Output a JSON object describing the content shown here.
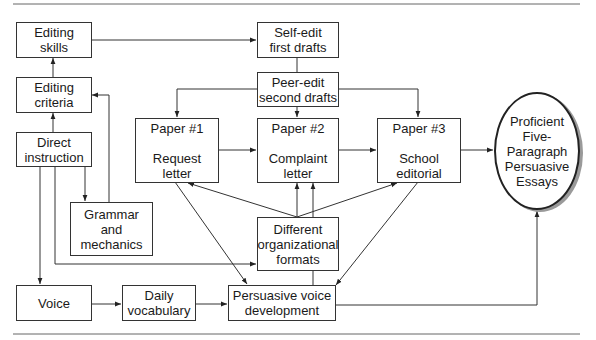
{
  "diagram": {
    "nodes": {
      "editing_skills": [
        "Editing",
        "skills"
      ],
      "editing_criteria": [
        "Editing",
        "criteria"
      ],
      "direct_instruction": [
        "Direct",
        "instruction"
      ],
      "grammar": [
        "Grammar",
        "and",
        "mechanics"
      ],
      "voice": [
        "Voice"
      ],
      "daily_vocab": [
        "Daily",
        "vocabulary"
      ],
      "persuasive_voice": [
        "Persuasive voice",
        "development"
      ],
      "self_edit": [
        "Self-edit",
        "first drafts"
      ],
      "peer_edit": [
        "Peer-edit",
        "second drafts"
      ],
      "paper1": {
        "title": "Paper #1",
        "lines": [
          "Request",
          "letter"
        ]
      },
      "paper2": {
        "title": "Paper #2",
        "lines": [
          "Complaint",
          "letter"
        ]
      },
      "paper3": {
        "title": "Paper #3",
        "lines": [
          "School",
          "editorial"
        ]
      },
      "org_formats": [
        "Different",
        "organizational",
        "formats"
      ],
      "outcome": [
        "Proficient",
        "Five-",
        "Paragraph",
        "Persuasive",
        "Essays"
      ]
    },
    "edges": [
      [
        "Direct instruction",
        "Editing criteria"
      ],
      [
        "Editing criteria",
        "Editing skills"
      ],
      [
        "Editing skills",
        "Self-edit first drafts"
      ],
      [
        "Self-edit first drafts",
        "Peer-edit second drafts"
      ],
      [
        "Peer-edit second drafts",
        "Paper #1"
      ],
      [
        "Peer-edit second drafts",
        "Paper #2"
      ],
      [
        "Peer-edit second drafts",
        "Paper #3"
      ],
      [
        "Paper #1",
        "Paper #2"
      ],
      [
        "Paper #2",
        "Paper #3"
      ],
      [
        "Paper #3",
        "Proficient Five-Paragraph Persuasive Essays"
      ],
      [
        "Direct instruction",
        "Grammar and mechanics"
      ],
      [
        "Grammar and mechanics",
        "Editing criteria"
      ],
      [
        "Direct instruction",
        "Different organizational formats"
      ],
      [
        "Direct instruction",
        "Voice"
      ],
      [
        "Voice",
        "Daily vocabulary"
      ],
      [
        "Daily vocabulary",
        "Persuasive voice development"
      ],
      [
        "Different organizational formats",
        "Paper #1"
      ],
      [
        "Different organizational formats",
        "Paper #2"
      ],
      [
        "Persuasive voice development",
        "Paper #2"
      ],
      [
        "Different organizational formats",
        "Paper #3"
      ],
      [
        "Paper #1",
        "Persuasive voice development"
      ],
      [
        "Paper #3",
        "Persuasive voice development"
      ],
      [
        "Persuasive voice development",
        "Proficient Five-Paragraph Persuasive Essays"
      ]
    ]
  }
}
